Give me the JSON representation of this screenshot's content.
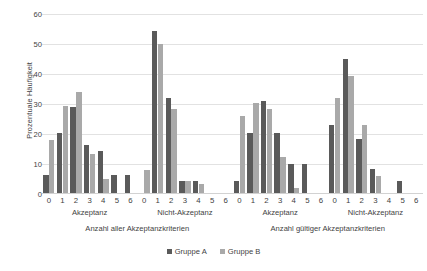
{
  "chart_data": {
    "type": "bar",
    "title": "",
    "subtitle": "",
    "xlabel": "",
    "ylabel": "Prozentuale Häufigkeit",
    "ylim": [
      0,
      60
    ],
    "yticks": [
      0,
      10,
      20,
      30,
      40,
      50,
      60
    ],
    "grid": true,
    "legend_position": "bottom-center",
    "categories": [
      "0",
      "1",
      "2",
      "3",
      "4",
      "5",
      "6"
    ],
    "panels": [
      {
        "name": "Anzahl aller Akzeptanzkriterien",
        "groups": [
          {
            "name": "Akzeptanz",
            "categories": [
              "0",
              "1",
              "2",
              "3",
              "4",
              "5",
              "6"
            ],
            "series": [
              {
                "name": "Gruppe A",
                "values": [
                  6.5,
                  20.5,
                  29.0,
                  16.5,
                  14.5,
                  6.5,
                  6.5
                ]
              },
              {
                "name": "Gruppe B",
                "values": [
                  18.0,
                  29.5,
                  34.0,
                  13.5,
                  5.0,
                  0.0,
                  0.0
                ]
              }
            ]
          },
          {
            "name": "Nicht-Akzeptanz",
            "categories": [
              "0",
              "1",
              "2",
              "3",
              "4",
              "5",
              "6"
            ],
            "series": [
              {
                "name": "Gruppe A",
                "values": [
                  0.0,
                  54.5,
                  32.0,
                  4.5,
                  4.5,
                  0.0,
                  0.0
                ]
              },
              {
                "name": "Gruppe B",
                "values": [
                  8.0,
                  50.0,
                  28.5,
                  4.5,
                  3.5,
                  0.0,
                  0.0
                ]
              }
            ]
          }
        ]
      },
      {
        "name": "Anzahl gültiger Akzeptanzkriterien",
        "groups": [
          {
            "name": "Akzeptanz",
            "categories": [
              "0",
              "1",
              "2",
              "3",
              "4",
              "5",
              "6"
            ],
            "series": [
              {
                "name": "Gruppe A",
                "values": [
                  4.5,
                  20.5,
                  31.0,
                  20.5,
                  10.0,
                  10.0,
                  0.0
                ]
              },
              {
                "name": "Gruppe B",
                "values": [
                  26.0,
                  30.5,
                  28.5,
                  12.5,
                  2.0,
                  0.0,
                  0.0
                ]
              }
            ]
          },
          {
            "name": "Nicht-Akzeptanz",
            "categories": [
              "0",
              "1",
              "2",
              "3",
              "4",
              "5",
              "6"
            ],
            "series": [
              {
                "name": "Gruppe A",
                "values": [
                  23.0,
                  45.0,
                  18.5,
                  8.5,
                  0.0,
                  4.5,
                  0.0
                ]
              },
              {
                "name": "Gruppe B",
                "values": [
                  32.0,
                  39.5,
                  23.0,
                  6.0,
                  0.0,
                  0.0,
                  0.0
                ]
              }
            ]
          }
        ]
      }
    ],
    "series_colors": {
      "Gruppe A": "#5a5a5a",
      "Gruppe B": "#a9a9a9"
    },
    "legend": [
      {
        "label": "Gruppe A",
        "color": "#5a5a5a"
      },
      {
        "label": "Gruppe B",
        "color": "#a9a9a9"
      }
    ],
    "gridline_color": "#e2e2e2",
    "text_color": "#3f3f3f",
    "background": "#ffffff"
  }
}
